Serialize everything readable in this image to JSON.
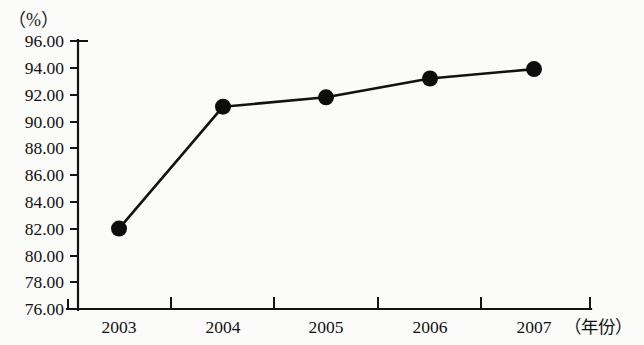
{
  "chart_data": {
    "type": "line",
    "title": "",
    "subtitle": "",
    "xlabel": "（年份）",
    "ylabel": "（%）",
    "categories": [
      "2003",
      "2004",
      "2005",
      "2006",
      "2007"
    ],
    "values": [
      82.0,
      91.1,
      91.8,
      93.2,
      93.9
    ],
    "series": [
      {
        "name": "",
        "values": [
          82.0,
          91.1,
          91.8,
          93.2,
          93.9
        ]
      }
    ],
    "ylim": [
      76.0,
      96.0
    ],
    "ytick_step": 2.0,
    "ytick_labels": [
      "96.00",
      "94.00",
      "92.00",
      "90.00",
      "88.00",
      "86.00",
      "84.00",
      "82.00",
      "80.00",
      "78.00",
      "76.00"
    ],
    "ytick_values": [
      96.0,
      94.0,
      92.0,
      90.0,
      88.0,
      86.0,
      84.0,
      82.0,
      80.0,
      78.0,
      76.0
    ],
    "xtick_labels": [
      "2003",
      "2004",
      "2005",
      "2006",
      "2007"
    ],
    "grid": false,
    "legend": false,
    "legend_position": "none",
    "marker": "circle",
    "line_color": "#121212",
    "marker_color": "#0d0d0d",
    "axis_color": "#141414",
    "background_color": "#fbfbf9"
  },
  "axes": {
    "y_unit_label": "（%）",
    "x_unit_label": "（年份）"
  }
}
